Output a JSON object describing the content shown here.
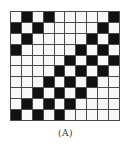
{
  "figure": {
    "caption": "(A)",
    "rows": 10,
    "cols": 10,
    "colors": {
      "filled": "#111111",
      "empty": "#f8f8f8",
      "grid_line": "#4a4a4a"
    },
    "pattern": [
      [
        0,
        1,
        0,
        1,
        0,
        0,
        0,
        0,
        0,
        1
      ],
      [
        1,
        0,
        1,
        0,
        0,
        0,
        0,
        0,
        1,
        0
      ],
      [
        0,
        1,
        0,
        0,
        0,
        0,
        0,
        1,
        0,
        1
      ],
      [
        1,
        0,
        0,
        0,
        0,
        0,
        1,
        0,
        1,
        0
      ],
      [
        0,
        0,
        0,
        0,
        0,
        1,
        0,
        1,
        0,
        1
      ],
      [
        0,
        0,
        0,
        0,
        1,
        0,
        1,
        0,
        1,
        0
      ],
      [
        0,
        0,
        0,
        1,
        0,
        1,
        0,
        1,
        0,
        0
      ],
      [
        0,
        0,
        1,
        0,
        1,
        0,
        1,
        0,
        0,
        0
      ],
      [
        0,
        1,
        0,
        1,
        0,
        1,
        0,
        0,
        0,
        0
      ],
      [
        1,
        0,
        1,
        0,
        1,
        0,
        0,
        0,
        0,
        0
      ]
    ]
  }
}
